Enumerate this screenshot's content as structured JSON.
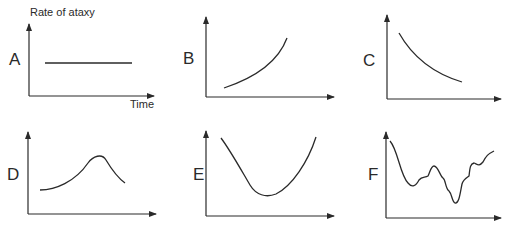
{
  "figure": {
    "y_axis_title": "Rate of ataxy",
    "x_axis_title": "Time",
    "panels": [
      {
        "id": "A",
        "label": "A",
        "shape": "constant (horizontal line)"
      },
      {
        "id": "B",
        "label": "B",
        "shape": "increasing, accelerating"
      },
      {
        "id": "C",
        "label": "C",
        "shape": "decreasing, decelerating"
      },
      {
        "id": "D",
        "label": "D",
        "shape": "rise to a single peak then fall"
      },
      {
        "id": "E",
        "label": "E",
        "shape": "U-shaped: fall to minimum then rise"
      },
      {
        "id": "F",
        "label": "F",
        "shape": "irregular oscillation"
      }
    ]
  },
  "colors": {
    "ink": "#2a2a2a",
    "background": "#ffffff"
  }
}
